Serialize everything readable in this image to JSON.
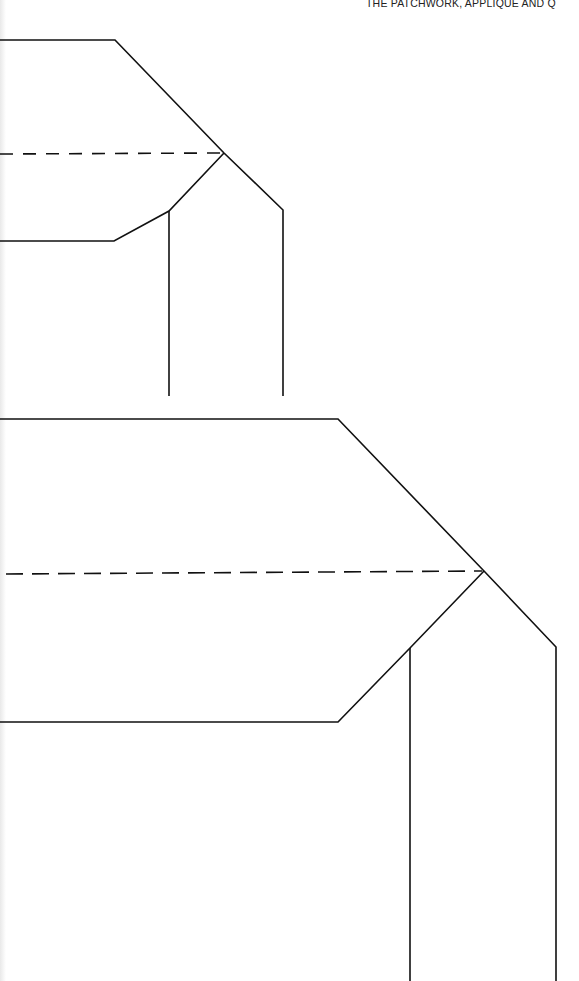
{
  "page": {
    "running_head": "THE PATCHWORK, APPLIQUE AND Q",
    "line_color": "#111111",
    "background": "#ffffff"
  },
  "templates": [
    {
      "name": "small-template",
      "outline": [
        [
          0,
          40
        ],
        [
          115,
          40
        ],
        [
          224,
          153
        ],
        [
          283,
          210
        ],
        [
          283,
          396
        ]
      ],
      "lower_outline": [
        [
          0,
          241
        ],
        [
          114,
          269
        ],
        [
          169,
          210
        ],
        [
          224,
          153
        ]
      ],
      "inner_vertical": [
        [
          169,
          210
        ],
        [
          169,
          396
        ]
      ],
      "fold_line": [
        [
          0,
          153
        ],
        [
          222,
          153
        ]
      ]
    },
    {
      "name": "large-template",
      "outline": [
        [
          0,
          419
        ],
        [
          338,
          419
        ],
        [
          484,
          571
        ],
        [
          556,
          647
        ],
        [
          556,
          981
        ]
      ],
      "lower_outline": [
        [
          0,
          722
        ],
        [
          338,
          722
        ],
        [
          410,
          648
        ],
        [
          484,
          571
        ]
      ],
      "inner_vertical": [
        [
          410,
          648
        ],
        [
          410,
          981
        ]
      ],
      "fold_line": [
        [
          0,
          571
        ],
        [
          482,
          571
        ]
      ]
    }
  ]
}
